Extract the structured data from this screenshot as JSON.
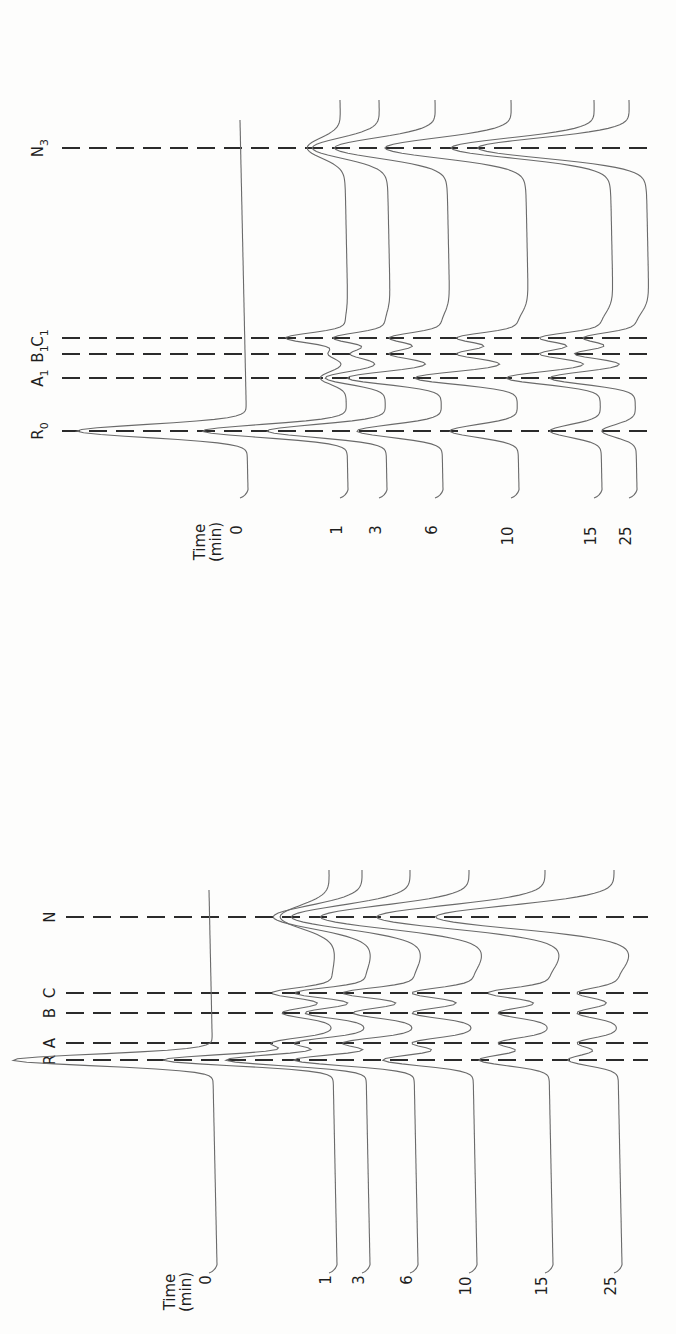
{
  "chart_data": [
    {
      "type": "line",
      "panel": "top",
      "orientation": "rotated-90-ccw",
      "title": "",
      "legend_title": "Time (min)",
      "series_labels": [
        "0",
        "1",
        "3",
        "6",
        "10",
        "15",
        "25"
      ],
      "reference_lines": [
        {
          "label": "R",
          "sub": "0",
          "y": 431
        },
        {
          "label": "A",
          "sub": "1",
          "y": 378
        },
        {
          "label": "B",
          "sub": "1",
          "y": 354
        },
        {
          "label": "C",
          "sub": "1",
          "y": 338
        },
        {
          "label": "N",
          "sub": "3",
          "y": 148
        }
      ],
      "series": [
        {
          "name": "0",
          "label_x": 248,
          "peaks": {
            "R0": 1.0,
            "A1": 0.0,
            "B1": 0.0,
            "C1": 0.0,
            "N3": 0.0
          }
        },
        {
          "name": "1",
          "label_x": 348,
          "peaks": {
            "R0": 0.85,
            "A1": 0.15,
            "B1": 0.1,
            "C1": 0.35,
            "N3": 0.2
          }
        },
        {
          "name": "3",
          "label_x": 387,
          "peaks": {
            "R0": 0.7,
            "A1": 0.35,
            "B1": 0.2,
            "C1": 0.3,
            "N3": 0.4
          }
        },
        {
          "name": "6",
          "label_x": 443,
          "peaks": {
            "R0": 0.5,
            "A1": 0.55,
            "B1": 0.3,
            "C1": 0.3,
            "N3": 0.6
          }
        },
        {
          "name": "10",
          "label_x": 519,
          "peaks": {
            "R0": 0.4,
            "A1": 0.6,
            "B1": 0.35,
            "C1": 0.35,
            "N3": 0.75
          }
        },
        {
          "name": "15",
          "label_x": 602,
          "peaks": {
            "R0": 0.3,
            "A1": 0.55,
            "B1": 0.35,
            "C1": 0.35,
            "N3": 0.85
          }
        },
        {
          "name": "25",
          "label_x": 637,
          "peaks": {
            "R0": 0.2,
            "A1": 0.5,
            "B1": 0.35,
            "C1": 0.3,
            "N3": 0.9
          }
        }
      ]
    },
    {
      "type": "line",
      "panel": "bottom",
      "orientation": "rotated-90-ccw",
      "title": "",
      "legend_title": "Time (min)",
      "series_labels": [
        "0",
        "1",
        "3",
        "6",
        "10",
        "15",
        "25"
      ],
      "reference_lines": [
        {
          "label": "R",
          "sub": "",
          "y": 1060
        },
        {
          "label": "A",
          "sub": "",
          "y": 1043
        },
        {
          "label": "B",
          "sub": "",
          "y": 1013
        },
        {
          "label": "C",
          "sub": "",
          "y": 993
        },
        {
          "label": "N",
          "sub": "",
          "y": 917
        }
      ],
      "series": [
        {
          "name": "0",
          "label_x": 217,
          "peaks": {
            "R": 1.0,
            "A": 0.0,
            "B": 0.0,
            "C": 0.0,
            "N": 0.0
          }
        },
        {
          "name": "1",
          "label_x": 337,
          "peaks": {
            "R": 0.85,
            "A": 0.3,
            "B": 0.25,
            "C": 0.3,
            "N": 0.25
          }
        },
        {
          "name": "3",
          "label_x": 370,
          "peaks": {
            "R": 0.7,
            "A": 0.35,
            "B": 0.3,
            "C": 0.35,
            "N": 0.45
          }
        },
        {
          "name": "6",
          "label_x": 418,
          "peaks": {
            "R": 0.6,
            "A": 0.35,
            "B": 0.3,
            "C": 0.35,
            "N": 0.6
          }
        },
        {
          "name": "10",
          "label_x": 477,
          "peaks": {
            "R": 0.45,
            "A": 0.3,
            "B": 0.3,
            "C": 0.3,
            "N": 0.75
          }
        },
        {
          "name": "15",
          "label_x": 553,
          "peaks": {
            "R": 0.35,
            "A": 0.25,
            "B": 0.25,
            "C": 0.3,
            "N": 0.85
          }
        },
        {
          "name": "25",
          "label_x": 622,
          "peaks": {
            "R": 0.25,
            "A": 0.2,
            "B": 0.2,
            "C": 0.2,
            "N": 0.9
          }
        }
      ]
    }
  ],
  "labels": {
    "time_word": "Time",
    "time_unit": "(min)"
  }
}
